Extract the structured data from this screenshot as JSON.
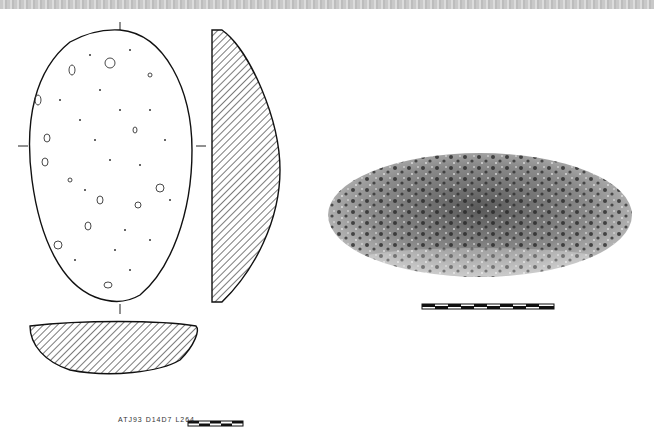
{
  "figure": {
    "label": "ATJ93 D14D7 L264",
    "views": [
      "plan-drawing",
      "profile-section",
      "transverse-section",
      "photograph"
    ],
    "scale_bars": [
      {
        "location": "below-photo",
        "segments": 10
      },
      {
        "location": "bottom-label",
        "segments": 5
      }
    ],
    "colors": {
      "ink": "#1a1a1a",
      "hatch": "#333333",
      "paper": "#ffffff",
      "stone_mid": "#8a8a8a"
    }
  }
}
